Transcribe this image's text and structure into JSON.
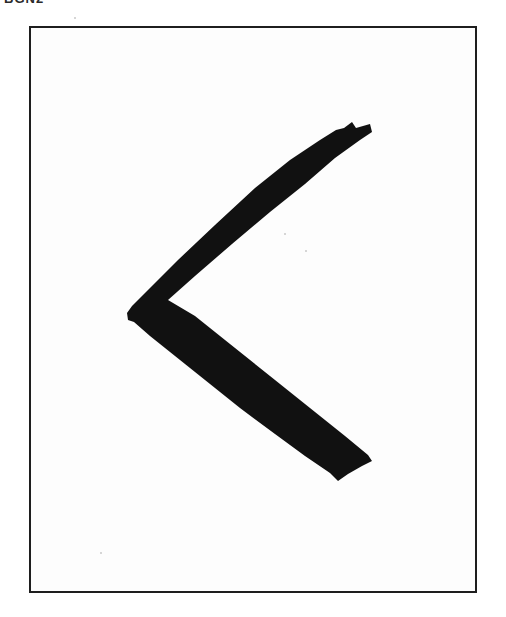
{
  "page": {
    "caption": "BGN2",
    "figure": {
      "description": "Brush-stroke rune glyph shaped like a left-pointing angle (<) inside a rectangular frame",
      "glyph_name": "kaun-rune-icon",
      "stroke_color": "#111111",
      "frame_color": "#1e1e1e",
      "background_color": "#ffffff"
    }
  }
}
